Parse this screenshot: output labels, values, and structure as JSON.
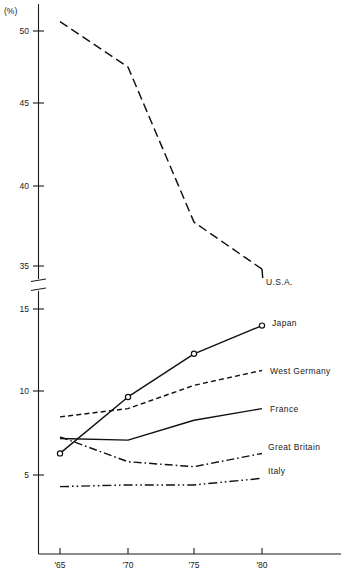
{
  "chart_data": {
    "type": "line",
    "title": "",
    "subtitle": "",
    "xlabel": "",
    "ylabel": "",
    "unit_label": "(%)",
    "x": [
      "'65",
      "'70",
      "'75",
      "'80"
    ],
    "categories": [
      "'65",
      "'70",
      "'75",
      "'80"
    ],
    "x_tick_labels": [
      "'65",
      "'70",
      "'75",
      "'80"
    ],
    "y_tick_labels_upper": [
      "50",
      "45",
      "40",
      "35"
    ],
    "y_tick_labels_lower": [
      "15",
      "10",
      "5"
    ],
    "y_axis_break": true,
    "y_axis_break_between": [
      35,
      15
    ],
    "ylim_upper": [
      35,
      52
    ],
    "ylim_lower": [
      3,
      15
    ],
    "grid": false,
    "legend_position": "right-inline-labels",
    "series": [
      {
        "name": "U.S.A.",
        "label": "U.S.A.",
        "style": "long-dash",
        "marker": "none",
        "axis": "upper",
        "values": [
          50.6,
          47.7,
          37.8,
          34.8
        ]
      },
      {
        "name": "Japan",
        "label": "Japan",
        "style": "solid",
        "marker": "open-circle",
        "axis": "lower",
        "values": [
          6.3,
          9.7,
          12.3,
          14.0
        ]
      },
      {
        "name": "West Germany",
        "label": "West Germany",
        "style": "short-dash",
        "marker": "none",
        "axis": "lower",
        "values": [
          8.5,
          9.0,
          10.4,
          11.3
        ]
      },
      {
        "name": "France",
        "label": "France",
        "style": "solid",
        "marker": "none",
        "axis": "lower",
        "values": [
          7.2,
          7.1,
          8.3,
          9.0
        ]
      },
      {
        "name": "Great Britain",
        "label": "Great Britain",
        "style": "dash-dot",
        "marker": "none",
        "axis": "lower",
        "values": [
          7.3,
          5.8,
          5.5,
          6.3
        ]
      },
      {
        "name": "Italy",
        "label": "Italy",
        "style": "dash-dot-dot",
        "marker": "none",
        "axis": "lower",
        "values": [
          4.3,
          4.4,
          4.4,
          4.8
        ]
      }
    ],
    "colors": {
      "line": "#111111",
      "axis": "#1a1a1a",
      "background": "#ffffff"
    }
  }
}
